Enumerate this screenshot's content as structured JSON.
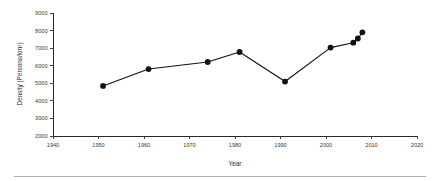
{
  "chart_data": {
    "type": "line",
    "title": "",
    "xlabel": "Year",
    "ylabel": "Density (Persons/km²)",
    "xlim": [
      1940,
      2020
    ],
    "ylim": [
      2000,
      9000
    ],
    "xticks": [
      1940,
      1950,
      1960,
      1970,
      1980,
      1990,
      2000,
      2010,
      2020
    ],
    "xtick_labels": [
      "1940",
      "1950",
      "1960",
      "1970",
      "1980",
      "1990",
      "2000",
      "2010",
      "2020"
    ],
    "yticks": [
      2000,
      3000,
      4000,
      5000,
      6000,
      7000,
      8000,
      9000
    ],
    "ytick_labels": [
      "2000",
      "3000",
      "4000",
      "5000",
      "6000",
      "7000",
      "8000",
      "9000"
    ],
    "grid": false,
    "legend": false,
    "marker": "filled-circle",
    "line_color": "#111111",
    "marker_color": "#111111",
    "x": [
      1951,
      1961,
      1974,
      1981,
      1991,
      2001,
      2006,
      2007,
      2008
    ],
    "values": [
      4850,
      5810,
      6210,
      6780,
      5100,
      7030,
      7310,
      7550,
      7900
    ],
    "series": [
      {
        "name": "Population density",
        "x": [
          1951,
          1961,
          1974,
          1981,
          1991,
          2001,
          2006,
          2007,
          2008
        ],
        "values": [
          4850,
          5810,
          6210,
          6780,
          5100,
          7030,
          7310,
          7550,
          7900
        ]
      }
    ],
    "points": [
      {
        "year": 1951,
        "density": 4850
      },
      {
        "year": 1961,
        "density": 5810
      },
      {
        "year": 1974,
        "density": 6210
      },
      {
        "year": 1981,
        "density": 6780
      },
      {
        "year": 1991,
        "density": 5100
      },
      {
        "year": 2001,
        "density": 7030
      },
      {
        "year": 2006,
        "density": 7310
      },
      {
        "year": 2007,
        "density": 7550
      },
      {
        "year": 2008,
        "density": 7900
      }
    ]
  },
  "figure": {
    "background_color": "#ffffff",
    "axis_color": "#2b2b2b",
    "footer_rule_color": "#9a9a9a"
  }
}
